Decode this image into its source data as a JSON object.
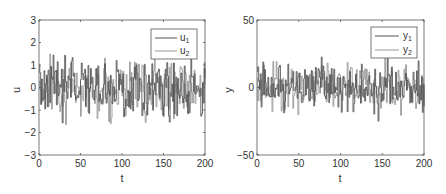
{
  "chart_data": [
    {
      "type": "line",
      "title": "",
      "xlabel": "t",
      "ylabel": "u",
      "xlim": [
        0,
        200
      ],
      "ylim": [
        -3,
        3
      ],
      "xticks": [
        "0",
        "50",
        "100",
        "150",
        "200"
      ],
      "yticks": [
        "3",
        "2",
        "1",
        "0",
        "-1",
        "-2",
        "-3"
      ],
      "legend": [
        "u₁",
        "u₂"
      ],
      "legend_position": "upper right",
      "grid": false,
      "series": [
        {
          "name": "u1",
          "color": "#555555",
          "description": "random piecewise-constant input, approx range -2.8 to 2.6"
        },
        {
          "name": "u2",
          "color": "#999999",
          "description": "random piecewise-constant input, approx range -2.5 to 2.0"
        }
      ]
    },
    {
      "type": "line",
      "title": "",
      "xlabel": "t",
      "ylabel": "y",
      "xlim": [
        0,
        200
      ],
      "ylim": [
        -50,
        50
      ],
      "xticks": [
        "0",
        "50",
        "100",
        "150",
        "200"
      ],
      "yticks": [
        "50",
        "0",
        "-50"
      ],
      "legend": [
        "y₁",
        "y₂"
      ],
      "legend_position": "upper right",
      "grid": false,
      "series": [
        {
          "name": "y1",
          "color": "#555555",
          "description": "output, approx range -40 to 45"
        },
        {
          "name": "y2",
          "color": "#999999",
          "description": "output, approx range -30 to 30"
        }
      ]
    }
  ],
  "left": {
    "ylabel": "u",
    "xlabel": "t",
    "legend1": "u",
    "legend2": "u",
    "sub1": "1",
    "sub2": "2",
    "yticks": [
      "3",
      "2",
      "1",
      "0",
      "−1",
      "−2",
      "−3"
    ],
    "xticks": [
      "0",
      "50",
      "100",
      "150",
      "200"
    ]
  },
  "right": {
    "ylabel": "y",
    "xlabel": "t",
    "legend1": "y",
    "legend2": "y",
    "sub1": "1",
    "sub2": "2",
    "yticks": [
      "50",
      "0",
      "−50"
    ],
    "xticks": [
      "0",
      "50",
      "100",
      "150",
      "200"
    ]
  }
}
